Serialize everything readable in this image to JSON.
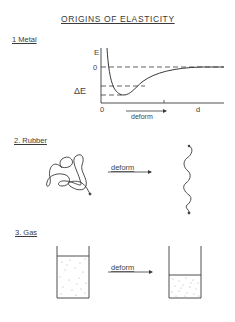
{
  "title": "ORIGINS  OF  ELASTICITY",
  "sections": [
    {
      "label": "1 Metal",
      "graph": {
        "y_axis_label": "E",
        "zero_label": "0",
        "delta_label": "ΔE",
        "origin_label": "0",
        "x_axis_label": "d",
        "arrow_label": "deform"
      }
    },
    {
      "label": "2. Rubber",
      "arrow_label": "deform"
    },
    {
      "label": "3. Gas",
      "arrow_label": "deform"
    }
  ],
  "colors": {
    "ink": "#3a3a3a",
    "background": "#ffffff"
  }
}
